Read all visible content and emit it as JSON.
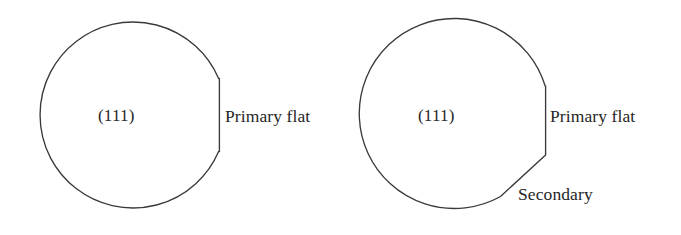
{
  "diagram": {
    "background_color": "#ffffff",
    "line_color": "#3a3a3a",
    "text_color": "#262626",
    "figures": [
      {
        "id": "primary-only",
        "plane_label": "(111)",
        "primary_flat_label": "Primary flat",
        "secondary_flat_label": "",
        "has_secondary_flat": false
      },
      {
        "id": "primary-secondary",
        "plane_label": "(111)",
        "primary_flat_label": "Primary flat",
        "secondary_flat_label": "Secondary",
        "has_secondary_flat": true
      }
    ]
  }
}
